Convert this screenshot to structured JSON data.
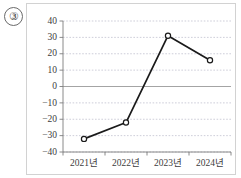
{
  "item_number": "③",
  "chart_data": {
    "type": "line",
    "title": "",
    "subtitle": "",
    "xlabel": "",
    "ylabel": "",
    "categories": [
      "2021년",
      "2022년",
      "2023년",
      "2024년"
    ],
    "values": [
      -32,
      -22,
      31,
      16
    ],
    "series": [
      {
        "name": "",
        "values": [
          -32,
          -22,
          31,
          16
        ]
      }
    ],
    "ylim": [
      -40,
      40
    ],
    "yticks": [
      40,
      30,
      20,
      10,
      0,
      -10,
      -20,
      -30,
      -40
    ],
    "ytick_labels": [
      "40",
      "30",
      "20",
      "10",
      "0",
      "−10",
      "−20",
      "−30",
      "−40"
    ],
    "grid": true,
    "grid_style": "dotted-horizontal",
    "zero_line": true,
    "legend": "none",
    "marker": "open-circle",
    "line_color": "#1a1a1a",
    "marker_fill": "#ffffff",
    "grid_color": "#b9b9c9",
    "axis_color": "#7d7d7d",
    "zero_line_color": "#9a9a9a"
  }
}
